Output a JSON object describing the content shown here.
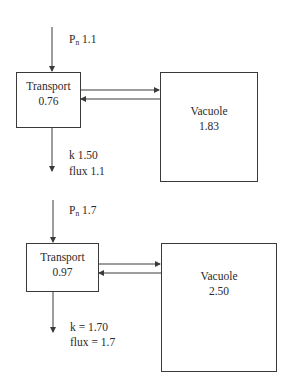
{
  "diagrams": [
    {
      "input": {
        "symbol": "P",
        "subscript": "n",
        "value": "1.1"
      },
      "transport": {
        "title": "Transport",
        "value": "0.76"
      },
      "vacuole": {
        "title": "Vacuole",
        "value": "1.83"
      },
      "output": {
        "k_line": "k 1.50",
        "flux_line": "flux 1.1"
      }
    },
    {
      "input": {
        "symbol": "P",
        "subscript": "n",
        "value": "1.7"
      },
      "transport": {
        "title": "Transport",
        "value": "0.97"
      },
      "vacuole": {
        "title": "Vacuole",
        "value": "2.50"
      },
      "output": {
        "k_line": "k = 1.70",
        "flux_line": "flux = 1.7"
      }
    }
  ],
  "colors": {
    "line": "#3a3a3a",
    "text": "#2a2a2a",
    "background": "#ffffff"
  }
}
